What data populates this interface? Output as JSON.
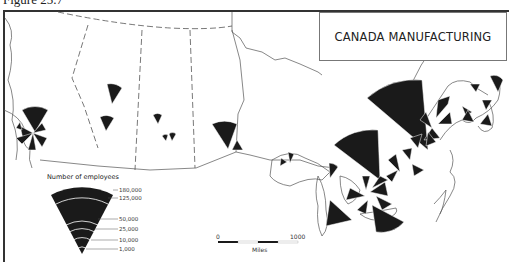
{
  "figure": {
    "label": "Figure 25.7"
  },
  "map": {
    "title": "CANADA MANUFACTURING",
    "region": "Canada",
    "symbol_type": "sector wedges sized by number of employees"
  },
  "legend": {
    "title": "Number of employees",
    "values": [
      "180,000",
      "125,000",
      "50,000",
      "25,000",
      "10,000",
      "1,000"
    ]
  },
  "scale_bar": {
    "start": "0",
    "end": "1000",
    "unit": "Miles"
  },
  "colors": {
    "ink": "#1a1a1a",
    "line": "#555555",
    "background": "#ffffff"
  }
}
